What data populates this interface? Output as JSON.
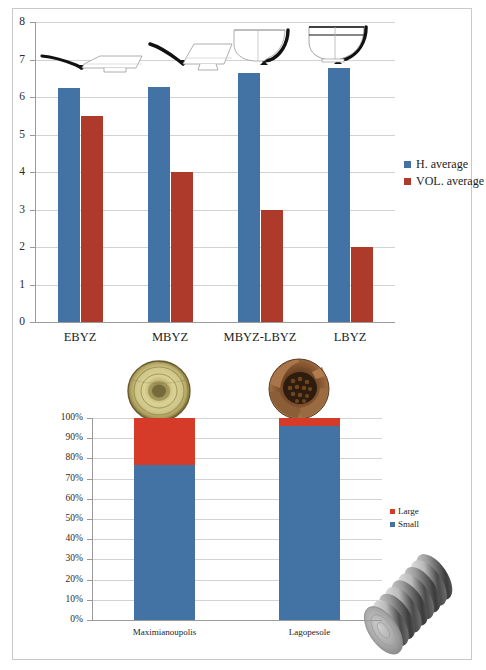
{
  "figure": {
    "background": "#ffffff",
    "border_color": "#c9c9c9"
  },
  "colors": {
    "blue": "#4372A4",
    "red": "#AE3A2C",
    "grid": "#d2d2d2",
    "axis": "#9a9a9a",
    "text": "#1c1c1c"
  },
  "chart_data": [
    {
      "type": "bar",
      "id": "vessel-averages",
      "title": "",
      "xlabel": "",
      "ylabel": "",
      "categories": [
        "EBYZ",
        "MBYZ",
        "MBYZ-LBYZ",
        "LBYZ"
      ],
      "series": [
        {
          "name": "H. average",
          "color": "#4372A4",
          "values": [
            6.25,
            6.28,
            6.65,
            6.78
          ]
        },
        {
          "name": "VOL. average",
          "color": "#AE3A2C",
          "values": [
            5.5,
            4.0,
            3.0,
            2.0
          ]
        }
      ],
      "ylim": [
        0,
        8
      ],
      "yticks": [
        0,
        1,
        2,
        3,
        4,
        5,
        6,
        7,
        8
      ],
      "ytick_labels": [
        "0",
        "1",
        "2",
        "3",
        "4",
        "5",
        "6",
        "7",
        "8"
      ],
      "grid": true,
      "legend_position": "right",
      "annotations": [
        {
          "name": "vessel-profile-ebyz",
          "caption": "shallow plate profile"
        },
        {
          "name": "vessel-profile-mbyz",
          "caption": "shallow footed bowl profile"
        },
        {
          "name": "vessel-profile-mbyz-lbyz",
          "caption": "deep bowl profile"
        },
        {
          "name": "vessel-profile-lbyz",
          "caption": "deep rimmed bowl profile"
        }
      ]
    },
    {
      "type": "bar",
      "subtype": "stacked-100",
      "id": "size-distribution",
      "title": "",
      "xlabel": "",
      "ylabel": "",
      "categories": [
        "Maximianoupolis",
        "Lagopesole"
      ],
      "series": [
        {
          "name": "Small",
          "color": "#4372A4",
          "values": [
            77,
            96
          ]
        },
        {
          "name": "Large",
          "color": "#D63B2A",
          "values": [
            23,
            4
          ]
        }
      ],
      "ylim": [
        0,
        100
      ],
      "yticks": [
        0,
        10,
        20,
        30,
        40,
        50,
        60,
        70,
        80,
        90,
        100
      ],
      "ytick_labels": [
        "0%",
        "10%",
        "20%",
        "30%",
        "40%",
        "50%",
        "60%",
        "70%",
        "80%",
        "90%",
        "100%"
      ],
      "grid": true,
      "legend_position": "right",
      "legend_order": [
        "Large",
        "Small"
      ],
      "annotations": [
        {
          "name": "photo-glazed-bowl",
          "caption": "glazed ceramic bowl, top view"
        },
        {
          "name": "photo-broken-vessel",
          "caption": "fragmented ceramic vessel"
        },
        {
          "name": "photo-coin-stack",
          "caption": "stack of coins"
        }
      ]
    }
  ],
  "top_chart": {
    "legend": [
      {
        "label": "H. average",
        "color": "#4372A4"
      },
      {
        "label": "VOL. average",
        "color": "#AE3A2C"
      }
    ],
    "ytick_labels": [
      "8",
      "7",
      "6",
      "5",
      "4",
      "3",
      "2",
      "1",
      "0"
    ],
    "categories": [
      "EBYZ",
      "MBYZ",
      "MBYZ-LBYZ",
      "LBYZ"
    ]
  },
  "bottom_chart": {
    "legend": [
      {
        "label": "Large",
        "color": "#D63B2A"
      },
      {
        "label": "Small",
        "color": "#4372A4"
      }
    ],
    "ytick_labels": [
      "100%",
      "90%",
      "80%",
      "70%",
      "60%",
      "50%",
      "40%",
      "30%",
      "20%",
      "10%",
      "0%"
    ],
    "categories": [
      "Maximianoupolis",
      "Lagopesole"
    ]
  }
}
